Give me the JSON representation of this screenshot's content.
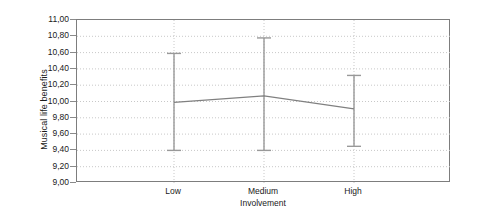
{
  "chart_data": {
    "type": "line",
    "title": "",
    "subtitle": "",
    "xlabel": "Involvement",
    "ylabel": "Musical life benefits",
    "categories": [
      "Low",
      "Medium",
      "High"
    ],
    "series": [
      {
        "name": "Musical life benefits",
        "values": [
          9.99,
          10.07,
          9.91
        ],
        "error_low": [
          9.4,
          9.4,
          9.45
        ],
        "error_high": [
          10.59,
          10.78,
          10.32
        ]
      }
    ],
    "ylim": [
      9.0,
      11.0
    ],
    "ytick_step": 0.2,
    "ytick_labels": [
      "11,00",
      "10,80",
      "10,60",
      "10,40",
      "10,20",
      "10,00",
      "9,80",
      "9,60",
      "9,40",
      "9,20",
      "9,00"
    ],
    "ytick_values": [
      11.0,
      10.8,
      10.6,
      10.4,
      10.2,
      10.0,
      9.8,
      9.6,
      9.4,
      9.2,
      9.0
    ],
    "grid": true,
    "grid_style": "dotted",
    "legend": "none",
    "error_bar_type": "confidence-interval",
    "colors": {
      "line": "#808080",
      "error_bar": "#999999",
      "grid": "#c8c8c8",
      "frame": "#7d7d7d",
      "text": "#1a1a1a",
      "background": "#ffffff"
    }
  }
}
